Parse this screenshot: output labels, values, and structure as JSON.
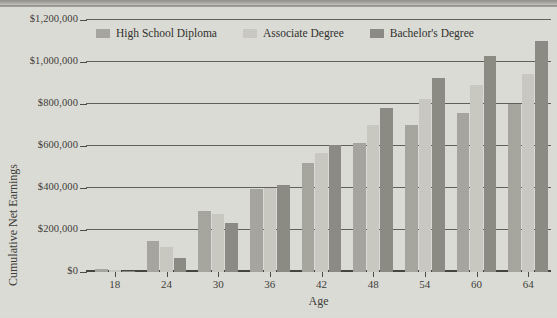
{
  "chart_data": {
    "type": "bar",
    "title": "",
    "subtitle": "",
    "xlabel": "Age",
    "ylabel": "Cumulative Net Earnings",
    "categories": [
      18,
      24,
      30,
      36,
      42,
      48,
      54,
      60,
      64
    ],
    "category_labels": [
      "18",
      "24",
      "30",
      "36",
      "42",
      "48",
      "54",
      "60",
      "64"
    ],
    "ylim": [
      0,
      1200000
    ],
    "ytick_values": [
      0,
      200000,
      400000,
      600000,
      800000,
      1000000,
      1200000
    ],
    "ytick_labels": [
      "$0",
      "$200,000",
      "$400,000",
      "$600,000",
      "$800,000",
      "$1,000,000",
      "$1,200,000"
    ],
    "grid": true,
    "legend_position": "top-center",
    "series": [
      {
        "name": "High School Diploma",
        "color": "#a6a69e",
        "values": [
          12000,
          150000,
          290000,
          395000,
          520000,
          615000,
          700000,
          755000,
          800000
        ]
      },
      {
        "name": "Associate Degree",
        "color": "#c9c9c2",
        "values": [
          8000,
          118000,
          275000,
          400000,
          565000,
          700000,
          825000,
          890000,
          945000
        ]
      },
      {
        "name": "Bachelor's Degree",
        "color": "#8b8b84",
        "values": [
          5000,
          68000,
          232000,
          415000,
          607000,
          782000,
          925000,
          1030000,
          1100000
        ]
      }
    ]
  },
  "legend": {
    "items": [
      {
        "label": "High School Diploma",
        "color": "#a6a69e"
      },
      {
        "label": "Associate Degree",
        "color": "#c9c9c2"
      },
      {
        "label": "Bachelor's Degree",
        "color": "#8b8b84"
      }
    ]
  },
  "axes": {
    "y_title": "Cumulative Net Earnings",
    "x_title": "Age"
  },
  "colors": {
    "background": "#dcdcd6",
    "gridline": "#4a4a46",
    "text": "#3d3d39",
    "series_high_school": "#a6a69e",
    "series_associate": "#c9c9c2",
    "series_bachelors": "#8b8b84"
  }
}
